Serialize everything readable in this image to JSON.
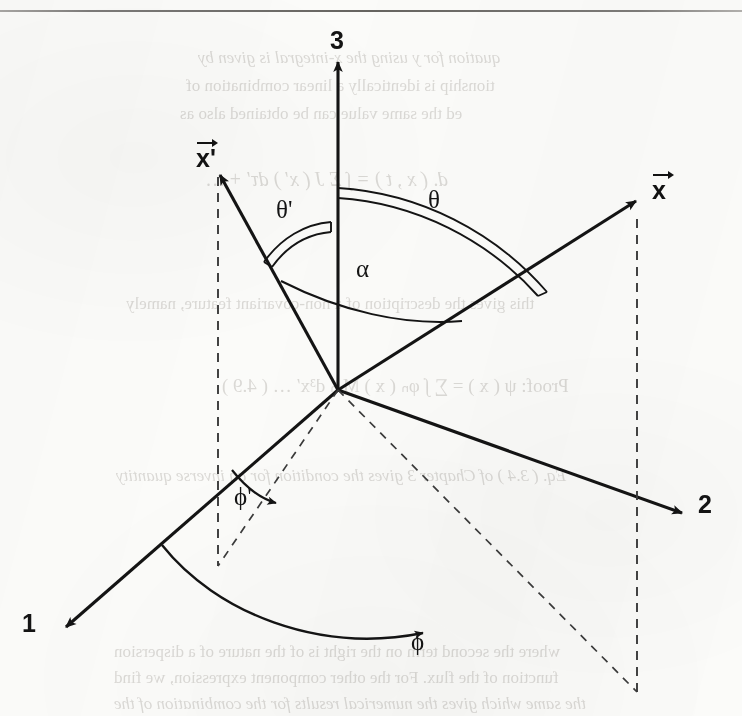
{
  "page": {
    "kind": "scanned-textbook-figure",
    "width": 742,
    "height": 716,
    "ink_color": "#141414",
    "paper_color": "#fbfbf9",
    "bleed_color": "#9a958f"
  },
  "rule": {
    "name": "top-horizontal-rule"
  },
  "figure": {
    "title": "",
    "origin": {
      "x": 338,
      "y": 390
    },
    "axes": [
      {
        "id": "axis-3",
        "label": "3",
        "label_x": 330,
        "label_y": 26,
        "tip_x": 338,
        "tip_y": 58,
        "style": "solid"
      },
      {
        "id": "axis-2",
        "label": "2",
        "label_x": 698,
        "label_y": 495,
        "tip_x": 686,
        "tip_y": 516,
        "style": "solid"
      },
      {
        "id": "axis-1",
        "label": "1",
        "label_x": 22,
        "label_y": 610,
        "tip_x": 62,
        "tip_y": 630,
        "style": "solid"
      }
    ],
    "vectors": [
      {
        "id": "vector-x-prime",
        "label": "x'",
        "label_x": 196,
        "label_y": 140,
        "tip_x": 218,
        "tip_y": 172,
        "style": "solid"
      },
      {
        "id": "vector-x",
        "label": "x",
        "label_x": 652,
        "label_y": 172,
        "tip_x": 640,
        "tip_y": 198,
        "style": "solid"
      }
    ],
    "angles": [
      {
        "id": "angle-theta-prime",
        "label": "θ'",
        "label_x": 276,
        "label_y": 196,
        "arc_style": "double-line",
        "between": [
          "axis-3",
          "vector-x-prime"
        ]
      },
      {
        "id": "angle-theta",
        "label": "θ",
        "label_x": 428,
        "label_y": 186,
        "arc_style": "double-line",
        "between": [
          "axis-3",
          "vector-x"
        ]
      },
      {
        "id": "angle-alpha",
        "label": "α",
        "label_x": 356,
        "label_y": 258,
        "arc_style": "single-line",
        "between": [
          "vector-x-prime",
          "vector-x"
        ]
      },
      {
        "id": "angle-phi-prime",
        "label": "ϕ'",
        "label_x": 234,
        "label_y": 485,
        "arc_style": "arrow-arc",
        "between": [
          "axis-1",
          "projection-x-prime"
        ]
      },
      {
        "id": "angle-phi",
        "label": "ϕ",
        "label_x": 411,
        "label_y": 631,
        "arc_style": "arrow-arc",
        "between": [
          "axis-1",
          "projection-x"
        ]
      }
    ],
    "dashed_elements": [
      {
        "id": "drop-line-x-prime",
        "from": {
          "x": 218,
          "y": 176
        },
        "to": {
          "x": 218,
          "y": 566
        }
      },
      {
        "id": "drop-line-x",
        "from": {
          "x": 637,
          "y": 218
        },
        "to": {
          "x": 637,
          "y": 692
        }
      },
      {
        "id": "projection-x-prime",
        "from": {
          "x": 338,
          "y": 390
        },
        "to": {
          "x": 218,
          "y": 566
        }
      },
      {
        "id": "projection-x",
        "from": {
          "x": 338,
          "y": 390
        },
        "to": {
          "x": 637,
          "y": 692
        }
      }
    ]
  },
  "bleed_text": {
    "lines": [
      {
        "text": "quation for y using the x-integral is given by",
        "x": 198,
        "y": 48,
        "size": 17
      },
      {
        "text": "tionship is identically a linear combination of",
        "x": 186,
        "y": 76,
        "size": 17
      },
      {
        "text": "ed the same value can be obtained also as",
        "x": 180,
        "y": 104,
        "size": 17
      },
      {
        "text": "d. ( x , t ) = ∫ Σ J ( x′ ) dτ′ + …",
        "x": 206,
        "y": 168,
        "size": 20
      },
      {
        "text": "this gives the description of a non-covariant feature, namely",
        "x": 126,
        "y": 294,
        "size": 17
      },
      {
        "text": "Proof:   ψ ( x ) = ∑ ∫ φₙ ( x ) M ₙ d³x′ … ( 4.9 )",
        "x": 222,
        "y": 374,
        "size": 19
      },
      {
        "text": "Eq. ( 3.4 ) of Chapter 3 gives the condition for an inverse quantity",
        "x": 116,
        "y": 466,
        "size": 17
      },
      {
        "text": "where the second term on the right is of the nature of a dispersion",
        "x": 114,
        "y": 642,
        "size": 17
      },
      {
        "text": "function of the flux. For the other component expression, we find",
        "x": 114,
        "y": 668,
        "size": 17
      },
      {
        "text": "the same which gives the numerical results for the combination of the",
        "x": 114,
        "y": 694,
        "size": 17
      }
    ]
  }
}
